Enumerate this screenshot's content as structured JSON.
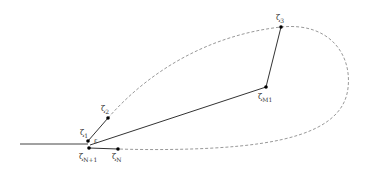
{
  "diagram": {
    "type": "contour-path",
    "colors": {
      "solid_line": "#333333",
      "dashed_curve": "#999999",
      "point": "#000000",
      "label": "#333333"
    },
    "points": [
      {
        "id": "zeta1",
        "label": "ζ1",
        "x": 88,
        "y": 141
      },
      {
        "id": "zeta2",
        "label": "ζ2",
        "x": 108,
        "y": 118
      },
      {
        "id": "zeta3",
        "label": "ζ3",
        "x": 281,
        "y": 27
      },
      {
        "id": "zetaM1",
        "label": "ζM1",
        "x": 266,
        "y": 87
      },
      {
        "id": "zetaN",
        "label": "ζN",
        "x": 118,
        "y": 149
      },
      {
        "id": "zetaN1",
        "label": "ζN+1",
        "x": 89,
        "y": 148
      }
    ],
    "labels": {
      "zeta1": {
        "base": "ζ",
        "sub": "1"
      },
      "zeta2": {
        "base": "ζ",
        "sub": "2"
      },
      "zeta3": {
        "base": "ζ",
        "sub": "3"
      },
      "zetaM1": {
        "base": "ζ",
        "sub": "M1"
      },
      "zetaN": {
        "base": "ζ",
        "sub": "N"
      },
      "zetaN1": {
        "base": "ζ",
        "sub": "N+1"
      },
      "epsilon": "ε"
    }
  }
}
